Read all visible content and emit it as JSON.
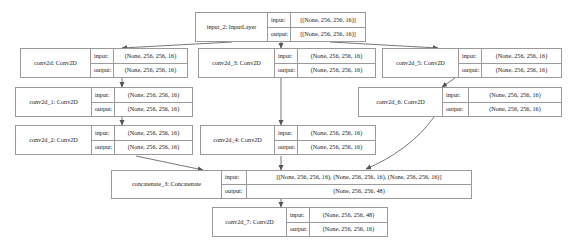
{
  "diagram": {
    "type": "keras-model-graph",
    "title": "",
    "style": {
      "border_color": "#9a9a9a",
      "edge_color": "#555555",
      "background": "#ffffff",
      "text_color": "#1a1a1a"
    },
    "io_labels": {
      "input": "input:",
      "output": "output:"
    },
    "nodes": [
      {
        "id": "input_2",
        "name": "input_2: InputLayer",
        "input": "[(None, 256, 256, 16)]",
        "output": "[(None, 256, 256, 16)]"
      },
      {
        "id": "conv2d",
        "name": "conv2d: Conv2D",
        "input": "(None, 256, 256, 16)",
        "output": "(None, 256, 256, 16)"
      },
      {
        "id": "conv2d_3",
        "name": "conv2d_3: Conv2D",
        "input": "(None, 256, 256, 16)",
        "output": "(None, 256, 256, 16)"
      },
      {
        "id": "conv2d_5",
        "name": "conv2d_5: Conv2D",
        "input": "(None, 256, 256, 16)",
        "output": "(None, 256, 256, 16)"
      },
      {
        "id": "conv2d_1",
        "name": "conv2d_1: Conv2D",
        "input": "(None, 256, 256, 16)",
        "output": "(None, 256, 256, 16)"
      },
      {
        "id": "conv2d_6",
        "name": "conv2d_6: Conv2D",
        "input": "(None, 256, 256, 16)",
        "output": "(None, 256, 256, 16)"
      },
      {
        "id": "conv2d_2",
        "name": "conv2d_2: Conv2D",
        "input": "(None, 256, 256, 16)",
        "output": "(None, 256, 256, 16)"
      },
      {
        "id": "conv2d_4",
        "name": "conv2d_4: Conv2D",
        "input": "(None, 256, 256, 16)",
        "output": "(None, 256, 256, 16)"
      },
      {
        "id": "concatenate_3",
        "name": "concatenate_3: Concatenate",
        "input": "[(None, 256, 256, 16), (None, 256, 256, 16), (None, 256, 256, 16)]",
        "output": "(None, 256, 256, 48)"
      },
      {
        "id": "conv2d_7",
        "name": "conv2d_7: Conv2D",
        "input": "(None, 256, 256, 48)",
        "output": "(None, 256, 256, 16)"
      }
    ],
    "edges": [
      {
        "from": "input_2",
        "to": "conv2d"
      },
      {
        "from": "input_2",
        "to": "conv2d_3"
      },
      {
        "from": "input_2",
        "to": "conv2d_5"
      },
      {
        "from": "conv2d",
        "to": "conv2d_1"
      },
      {
        "from": "conv2d_1",
        "to": "conv2d_2"
      },
      {
        "from": "conv2d_5",
        "to": "conv2d_6"
      },
      {
        "from": "conv2d_3",
        "to": "conv2d_4"
      },
      {
        "from": "conv2d_2",
        "to": "concatenate_3"
      },
      {
        "from": "conv2d_4",
        "to": "concatenate_3"
      },
      {
        "from": "conv2d_6",
        "to": "concatenate_3"
      },
      {
        "from": "concatenate_3",
        "to": "conv2d_7"
      }
    ]
  }
}
